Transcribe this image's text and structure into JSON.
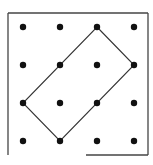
{
  "diagram": {
    "grid": {
      "rows": 4,
      "cols": 4,
      "x_positions": [
        23,
        60,
        97,
        134
      ],
      "y_positions": [
        27,
        65,
        103,
        141
      ],
      "dot_radius": 3.2,
      "dot_color": "#111111"
    },
    "frame": {
      "left": 8,
      "top": 13,
      "right": 148,
      "bottom": 155,
      "bottom_edge_start_x": 86,
      "stroke_color": "#444444"
    },
    "shape": {
      "type": "rectangle",
      "vertices_grid": [
        [
          2,
          0
        ],
        [
          3,
          1
        ],
        [
          1,
          3
        ],
        [
          0,
          2
        ]
      ],
      "stroke_color": "#333333"
    }
  }
}
